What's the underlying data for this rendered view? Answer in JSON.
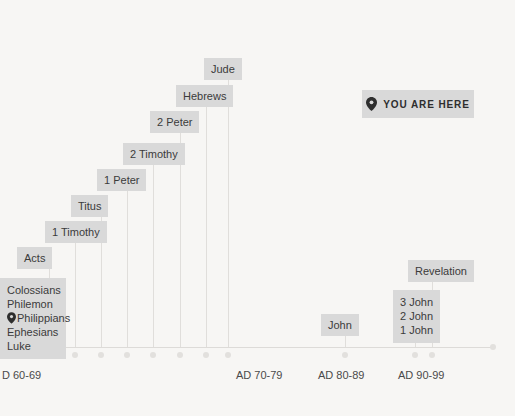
{
  "chart_data": {
    "type": "timeline",
    "title": "",
    "xlabel": "",
    "ylabel": "",
    "axis_ticks": [
      {
        "label": "D 60-69",
        "x": 2
      },
      {
        "label": "AD 70-79",
        "x": 236
      },
      {
        "label": "AD 80-89",
        "x": 318
      },
      {
        "label": "AD 90-99",
        "x": 398
      }
    ],
    "you_are_here": {
      "label": "YOU ARE HERE",
      "icon": "map-pin-icon"
    },
    "events": [
      {
        "id": "luke-group",
        "lines": [
          "Colossians",
          "Philemon",
          "Philippians",
          "Ephesians",
          "Luke"
        ],
        "pinned_line": "Philippians",
        "box_left": 0,
        "box_top": 278,
        "box_width": 66,
        "stem_x": 23,
        "stem_top": 348,
        "stem_bottom": 348,
        "dot_x": 23
      },
      {
        "id": "acts",
        "lines": [
          "Acts"
        ],
        "box_left": 17,
        "box_top": 247,
        "stem_x": 49,
        "stem_top": 269,
        "dot_x": 49
      },
      {
        "id": "1-timothy",
        "lines": [
          "1 Timothy"
        ],
        "box_left": 45,
        "box_top": 221,
        "stem_x": 75,
        "stem_top": 243,
        "dot_x": 75
      },
      {
        "id": "titus",
        "lines": [
          "Titus"
        ],
        "box_left": 71,
        "box_top": 195,
        "stem_x": 101,
        "stem_top": 217,
        "dot_x": 101
      },
      {
        "id": "1-peter",
        "lines": [
          "1 Peter"
        ],
        "box_left": 97,
        "box_top": 169,
        "stem_x": 127,
        "stem_top": 191,
        "dot_x": 127
      },
      {
        "id": "2-timothy",
        "lines": [
          "2 Timothy"
        ],
        "box_left": 123,
        "box_top": 143,
        "stem_x": 153,
        "stem_top": 165,
        "dot_x": 153
      },
      {
        "id": "2-peter",
        "lines": [
          "2 Peter"
        ],
        "box_left": 150,
        "box_top": 111,
        "stem_x": 180,
        "stem_top": 133,
        "dot_x": 180
      },
      {
        "id": "hebrews",
        "lines": [
          "Hebrews"
        ],
        "box_left": 176,
        "box_top": 85,
        "stem_x": 206,
        "stem_top": 107,
        "dot_x": 206
      },
      {
        "id": "jude",
        "lines": [
          "Jude"
        ],
        "box_left": 204,
        "box_top": 58,
        "stem_x": 228,
        "stem_top": 80,
        "dot_x": 228
      },
      {
        "id": "john",
        "lines": [
          "John"
        ],
        "box_left": 321,
        "box_top": 314,
        "stem_x": 345,
        "stem_top": 336,
        "dot_x": 345
      },
      {
        "id": "johannine-letters",
        "lines": [
          "3 John",
          "2 John",
          "1 John"
        ],
        "box_left": 393,
        "box_top": 290,
        "box_width": 47,
        "stem_x": 415,
        "stem_top": 337,
        "dot_x": 415
      },
      {
        "id": "revelation",
        "lines": [
          "Revelation"
        ],
        "box_left": 408,
        "box_top": 260,
        "stem_x": 432,
        "stem_top": 282,
        "dot_x": 432
      }
    ],
    "extra_dots": [],
    "colors": {
      "background": "#f7f6f4",
      "box_fill": "#d9d9d9",
      "text": "#3b3b3b",
      "axis": "#dddbd8",
      "dot": "#e2e0dd"
    }
  }
}
